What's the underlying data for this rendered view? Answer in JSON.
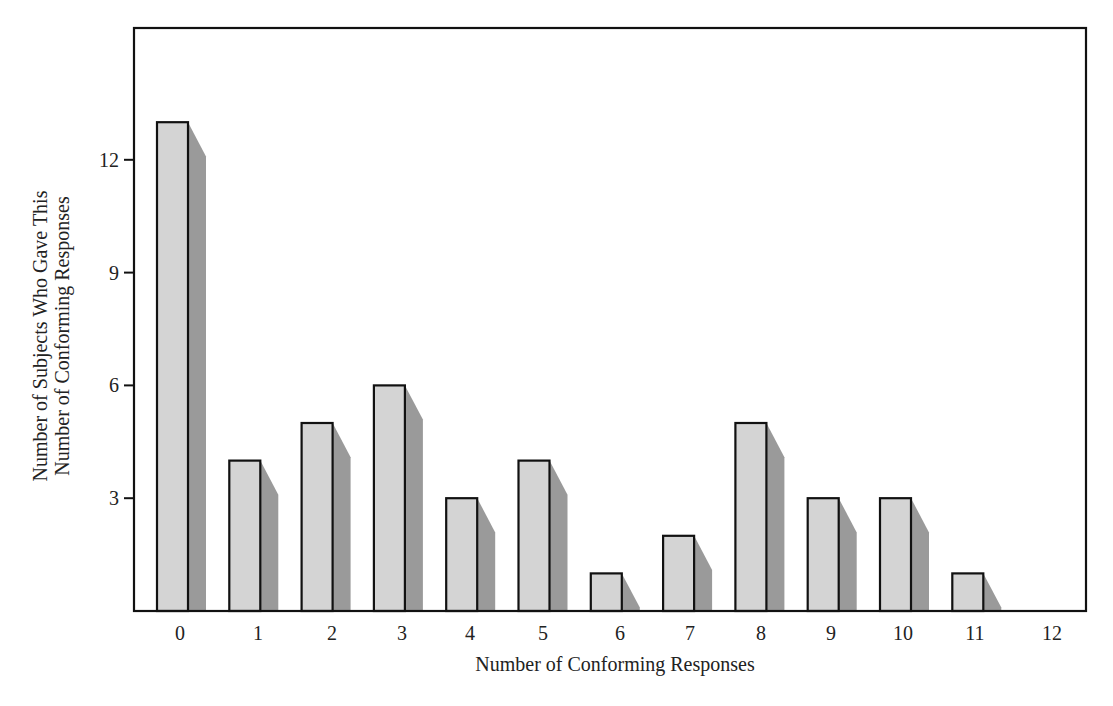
{
  "chart_data": {
    "type": "bar",
    "title": "",
    "xlabel": "Number of Conforming Responses",
    "ylabel": [
      "Number of Subjects Who Gave This",
      "Number of Conforming Responses"
    ],
    "categories": [
      "0",
      "1",
      "2",
      "3",
      "4",
      "5",
      "6",
      "7",
      "8",
      "9",
      "10",
      "11",
      "12"
    ],
    "values": [
      13,
      4,
      5,
      6,
      3,
      4,
      1,
      2,
      5,
      3,
      3,
      1,
      0
    ],
    "yticks": [
      3,
      6,
      9,
      12
    ],
    "ylim": [
      0,
      15.5
    ],
    "grid": false,
    "legend": null,
    "style": {
      "bar_fill": "#d4d4d4",
      "bar_stroke": "#111111",
      "shadow_fill": "#9a9a9a",
      "frame_stroke": "#111111"
    }
  }
}
